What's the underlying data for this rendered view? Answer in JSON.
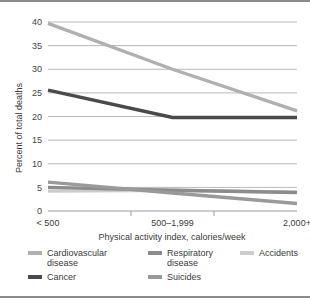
{
  "chart_data": {
    "type": "line",
    "title": "",
    "xlabel": "Physical activity index, calories/week",
    "ylabel": "Percent of total deaths",
    "categories": [
      "< 500",
      "500–1,999",
      "2,000+"
    ],
    "ylim": [
      0,
      40
    ],
    "yticks": [
      0,
      5,
      10,
      15,
      20,
      25,
      30,
      35,
      40
    ],
    "ytick_labels": [
      "0",
      "5",
      "10",
      "15",
      "20",
      "25",
      "30",
      "35",
      "40"
    ],
    "grid": true,
    "legend_position": "bottom",
    "series": [
      {
        "name": "Cardiovascular\ndisease",
        "values": [
          39.7,
          30.0,
          21.2
        ],
        "color": "#b0b0b0"
      },
      {
        "name": "Respiratory\ndisease",
        "values": [
          5.0,
          4.4,
          3.9
        ],
        "color": "#8c8c8c"
      },
      {
        "name": "Accidents",
        "values": [
          4.2,
          4.4,
          4.0
        ],
        "color": "#cccccc"
      },
      {
        "name": "Cancer",
        "values": [
          25.6,
          19.8,
          19.8
        ],
        "color": "#4a4a4a"
      },
      {
        "name": "Suicides",
        "values": [
          6.1,
          3.8,
          1.6
        ],
        "color": "#9a9a9a"
      }
    ]
  },
  "legend": {
    "items": [
      {
        "label": "Cardiovascular\ndisease",
        "color": "#b0b0b0"
      },
      {
        "label": "Respiratory\ndisease",
        "color": "#8c8c8c"
      },
      {
        "label": "Accidents",
        "color": "#cccccc"
      },
      {
        "label": "Cancer",
        "color": "#4a4a4a"
      },
      {
        "label": "Suicides",
        "color": "#9a9a9a"
      }
    ]
  },
  "axes": {
    "y_title": "Percent of total deaths",
    "x_title": "Physical activity index, calories/week"
  }
}
